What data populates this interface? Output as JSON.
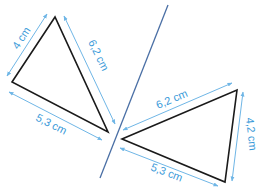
{
  "colors": {
    "triangle_stroke": "#1a1a1a",
    "dimension": "#6fb6e6",
    "label": "#3a9ad9",
    "mirror_line": "#4a6fa5"
  },
  "left_triangle": {
    "side_left": "4 cm",
    "side_right": "6,2 cm",
    "side_bottom": "5,3 cm"
  },
  "right_triangle": {
    "side_top": "6,2 cm",
    "side_right": "4,2 cm",
    "side_bottom": "5,3 cm"
  }
}
